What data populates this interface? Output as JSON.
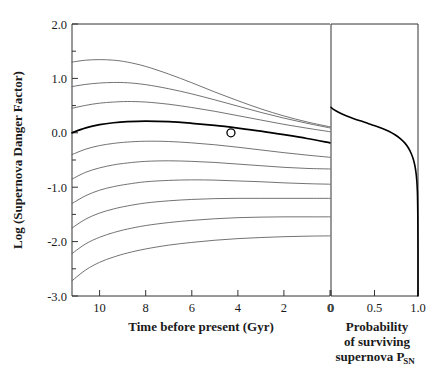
{
  "chart_data": {
    "type": "line",
    "title": "",
    "panels": [
      {
        "name": "danger-factor-panel",
        "xlabel": "Time before present (Gyr)",
        "ylabel": "Log (Supernova Danger Factor)",
        "xlim": [
          11.2,
          0
        ],
        "ylim": [
          -3.0,
          2.0
        ],
        "x_reversed": true,
        "grid": false,
        "legend": "none",
        "xticks": [
          10,
          8,
          6,
          4,
          2,
          0
        ],
        "xtick_labels": [
          "10",
          "8",
          "6",
          "4",
          "2",
          "0"
        ],
        "yticks": [
          2.0,
          1.0,
          0.0,
          -1.0,
          -2.0,
          -3.0
        ],
        "ytick_labels": [
          "2.0",
          "1.0",
          "0.0",
          "-1.0",
          "-2.0",
          "-3.0"
        ],
        "minor_yticks": [
          1.5,
          0.5,
          -0.5,
          -1.5,
          -2.5
        ],
        "x": [
          11.2,
          10.6,
          10.0,
          9.4,
          8.8,
          8.0,
          7.0,
          6.0,
          5.0,
          4.0,
          3.0,
          2.0,
          1.0,
          0.0
        ],
        "series": [
          {
            "name": "curve-1",
            "emphasis": "normal",
            "values": [
              1.3,
              1.335,
              1.345,
              1.335,
              1.3,
              1.22,
              1.08,
              0.92,
              0.75,
              0.59,
              0.44,
              0.31,
              0.2,
              0.11
            ]
          },
          {
            "name": "curve-2",
            "emphasis": "normal",
            "values": [
              0.85,
              0.89,
              0.915,
              0.925,
              0.92,
              0.885,
              0.81,
              0.715,
              0.605,
              0.49,
              0.375,
              0.27,
              0.175,
              0.09
            ]
          },
          {
            "name": "curve-3",
            "emphasis": "normal",
            "values": [
              0.45,
              0.505,
              0.545,
              0.565,
              0.575,
              0.565,
              0.525,
              0.465,
              0.395,
              0.315,
              0.235,
              0.155,
              0.085,
              0.02
            ]
          },
          {
            "name": "curve-4-bold",
            "emphasis": "bold",
            "values": [
              0.0,
              0.09,
              0.15,
              0.185,
              0.205,
              0.215,
              0.205,
              0.175,
              0.135,
              0.085,
              0.03,
              -0.035,
              -0.105,
              -0.185
            ]
          },
          {
            "name": "curve-5",
            "emphasis": "normal",
            "values": [
              -0.4,
              -0.3,
              -0.235,
              -0.195,
              -0.17,
              -0.155,
              -0.16,
              -0.185,
              -0.22,
              -0.265,
              -0.315,
              -0.365,
              -0.41,
              -0.45
            ]
          },
          {
            "name": "curve-6",
            "emphasis": "normal",
            "values": [
              -0.85,
              -0.725,
              -0.645,
              -0.59,
              -0.555,
              -0.525,
              -0.515,
              -0.525,
              -0.545,
              -0.575,
              -0.605,
              -0.635,
              -0.655,
              -0.665
            ]
          },
          {
            "name": "curve-7",
            "emphasis": "normal",
            "values": [
              -1.3,
              -1.155,
              -1.055,
              -0.99,
              -0.945,
              -0.9,
              -0.875,
              -0.865,
              -0.87,
              -0.885,
              -0.9,
              -0.92,
              -0.935,
              -0.945
            ]
          },
          {
            "name": "curve-8",
            "emphasis": "normal",
            "values": [
              -1.75,
              -1.585,
              -1.475,
              -1.4,
              -1.345,
              -1.29,
              -1.25,
              -1.225,
              -1.21,
              -1.205,
              -1.205,
              -1.205,
              -1.205,
              -1.205
            ]
          },
          {
            "name": "curve-9",
            "emphasis": "normal",
            "values": [
              -2.22,
              -2.04,
              -1.92,
              -1.835,
              -1.77,
              -1.705,
              -1.65,
              -1.61,
              -1.58,
              -1.56,
              -1.55,
              -1.545,
              -1.545,
              -1.545
            ]
          },
          {
            "name": "curve-10",
            "emphasis": "normal",
            "values": [
              -2.72,
              -2.52,
              -2.38,
              -2.285,
              -2.21,
              -2.135,
              -2.065,
              -2.015,
              -1.975,
              -1.945,
              -1.925,
              -1.91,
              -1.9,
              -1.895
            ]
          }
        ],
        "marker": {
          "name": "present-epoch-marker",
          "x": 4.3,
          "y": 0.0,
          "style": "open-circle"
        }
      },
      {
        "name": "survival-probability-panel",
        "xlabel_lines": [
          "Probability",
          "of surviving",
          "supernova P"
        ],
        "xlabel_subscript": "SN",
        "ylabel": "",
        "xlim": [
          0,
          1.0
        ],
        "ylim": [
          -3.0,
          2.0
        ],
        "grid": false,
        "legend": "none",
        "xticks": [
          0,
          0.5,
          1.0
        ],
        "xtick_labels": [
          "0",
          "0.5",
          "1.0"
        ],
        "curve_name": "survival-probability-curve",
        "probability": [
          0.0,
          0.02,
          0.06,
          0.115,
          0.18,
          0.255,
          0.335,
          0.42,
          0.505,
          0.59,
          0.67,
          0.74,
          0.8,
          0.85,
          0.89,
          0.922,
          0.947,
          0.965,
          0.978,
          0.987,
          0.993,
          0.996,
          0.998,
          0.999,
          1.0,
          1.0,
          1.0
        ],
        "log_danger_factor": [
          0.47,
          0.44,
          0.4,
          0.355,
          0.31,
          0.265,
          0.22,
          0.175,
          0.13,
          0.08,
          0.025,
          -0.04,
          -0.11,
          -0.19,
          -0.28,
          -0.38,
          -0.49,
          -0.61,
          -0.745,
          -0.9,
          -1.08,
          -1.29,
          -1.54,
          -1.82,
          -2.15,
          -2.6,
          -3.0
        ]
      }
    ]
  },
  "axes": {
    "left_panel": {
      "ylabel": "Log (Supernova Danger Factor)",
      "xlabel": "Time before present (Gyr)",
      "xtick_0": "10",
      "xtick_1": "8",
      "xtick_2": "6",
      "xtick_3": "4",
      "xtick_4": "2",
      "xtick_5": "0",
      "ytick_0": "2.0",
      "ytick_1": "1.0",
      "ytick_2": "0.0",
      "ytick_3": "-1.0",
      "ytick_4": "-2.0",
      "ytick_5": "-3.0"
    },
    "right_panel": {
      "xtick_0": "0",
      "xtick_1": "0.5",
      "xtick_2": "1.0",
      "xlabel_line1": "Probability",
      "xlabel_line2": "of surviving",
      "xlabel_line3": "supernova P",
      "xlabel_subscript": "SN"
    }
  },
  "colors": {
    "curve": "#5a5a5a",
    "curve_bold": "#000000",
    "axis": "#333333",
    "text": "#1a1a1a",
    "background": "#ffffff"
  }
}
